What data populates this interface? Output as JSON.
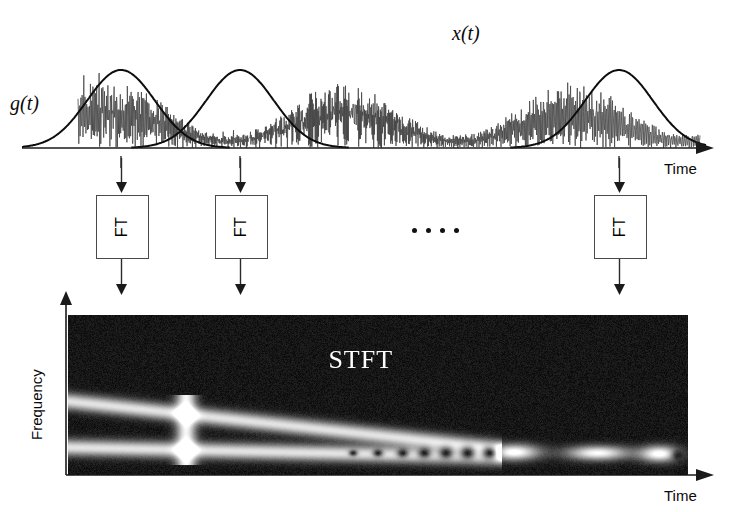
{
  "figure": {
    "title_implicit": "Short-Time Fourier Transform (STFT) schematic",
    "background_color": "#ffffff",
    "ink_color": "#0a0a0a"
  },
  "signal_panel": {
    "signal_label": "x(t)",
    "window_label": "g(t)",
    "time_axis_label": "Time",
    "axis": {
      "x_start": 22,
      "x_end": 712,
      "y": 148
    },
    "windows": [
      {
        "center": 121,
        "sigma": 34,
        "height": 78
      },
      {
        "center": 240,
        "sigma": 34,
        "height": 78
      },
      {
        "center": 619,
        "sigma": 34,
        "height": 78
      }
    ],
    "tick_positions": [
      121,
      240,
      619
    ]
  },
  "transform_row": {
    "box_label": "FT",
    "ellipsis_label": "....",
    "boxes": [
      {
        "x": 96,
        "y": 195,
        "w": 51,
        "h": 62
      },
      {
        "x": 215,
        "y": 195,
        "w": 51,
        "h": 62
      },
      {
        "x": 594,
        "y": 195,
        "w": 51,
        "h": 62
      }
    ],
    "ellipsis_dot_count": 4
  },
  "stft_panel": {
    "panel_label": "STFT",
    "frequency_axis_label": "Frequency",
    "time_axis_label": "Time",
    "plot_box": {
      "x": 68,
      "y": 315,
      "w": 620,
      "h": 160
    }
  },
  "chart_data": {
    "type": "heatmap",
    "title": "STFT",
    "xlabel": "Time",
    "ylabel": "Frequency",
    "colormap": "grayscale",
    "grid": false,
    "legend": false,
    "xlim": [
      0,
      1
    ],
    "ylim": [
      0,
      1
    ],
    "ridges": [
      {
        "name": "upper-chirp",
        "x_start": 0.0,
        "y_start": 0.46,
        "x_end": 0.7,
        "y_end": 0.16,
        "brightness": 0.82,
        "thickness": 0.075
      },
      {
        "name": "lower-chirp",
        "x_start": 0.0,
        "y_start": 0.17,
        "x_end": 0.7,
        "y_end": 0.11,
        "brightness": 0.82,
        "thickness": 0.075
      }
    ],
    "vertical_burst": {
      "name": "transient-bar",
      "x": 0.19,
      "brightness": 0.9,
      "width": 0.022
    },
    "interference_dots": {
      "name": "beat-nulls",
      "x_values": [
        0.46,
        0.5,
        0.54,
        0.575,
        0.61,
        0.645,
        0.68
      ],
      "y": 0.135,
      "brightness": 0.02
    },
    "blobs": [
      {
        "name": "blob-1",
        "x": 0.72,
        "y": 0.14,
        "rx": 0.045,
        "ry": 0.055,
        "brightness": 1.0
      },
      {
        "name": "blob-2",
        "x": 0.855,
        "y": 0.135,
        "rx": 0.055,
        "ry": 0.05,
        "brightness": 0.95
      },
      {
        "name": "blob-3",
        "x": 0.955,
        "y": 0.13,
        "rx": 0.035,
        "ry": 0.055,
        "brightness": 1.0
      }
    ],
    "noise_floor": 0.05,
    "noise_amplitude": 0.07
  }
}
